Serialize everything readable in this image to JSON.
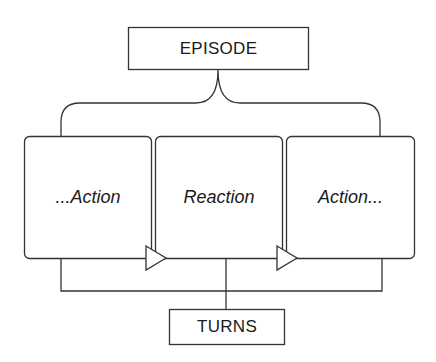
{
  "diagram": {
    "top_node": {
      "label": "EPISODE"
    },
    "bottom_node": {
      "label": "TURNS"
    },
    "turns": [
      {
        "label": "...Action"
      },
      {
        "label": "Reaction"
      },
      {
        "label": "Action..."
      }
    ],
    "colors": {
      "stroke": "#333333",
      "background": "#ffffff",
      "text": "#1a1a1a"
    }
  }
}
